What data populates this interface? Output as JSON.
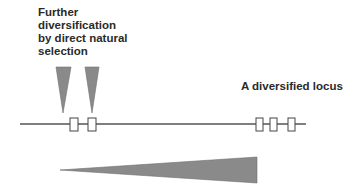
{
  "labels": {
    "further": [
      "Further",
      "diversification",
      "by direct natural",
      "selection"
    ],
    "locus": "A diversified locus"
  },
  "colors": {
    "triangle_fill": "#8a8a8a",
    "line": "#555555",
    "box_stroke": "#444444",
    "box_fill": "#ffffff"
  },
  "shapes": {
    "locus_line": {
      "x1": 20,
      "x2": 306,
      "y": 124
    },
    "left_boxes": [
      {
        "x": 70,
        "w": 8
      },
      {
        "x": 88,
        "w": 8
      }
    ],
    "right_boxes": [
      {
        "x": 256,
        "w": 7
      },
      {
        "x": 270,
        "w": 7
      },
      {
        "x": 288,
        "w": 7
      }
    ],
    "pointer_triangles": [
      {
        "left": 56,
        "right": 71,
        "tip": 63
      },
      {
        "left": 85,
        "right": 99,
        "tip": 92
      }
    ],
    "gradient_wedge": {
      "tip_x": 60,
      "tip_y": 170,
      "base_x": 257,
      "base_top": 157,
      "base_bottom": 183
    }
  }
}
